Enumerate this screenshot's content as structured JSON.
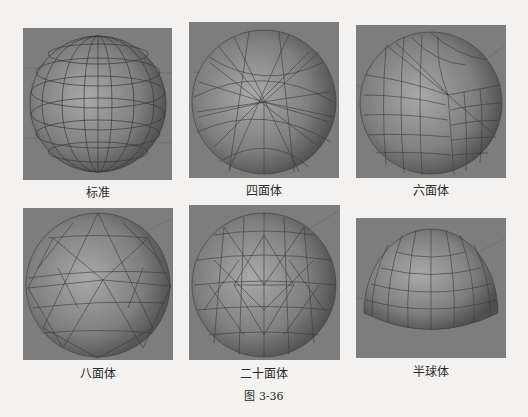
{
  "figure": {
    "label": "图 3-36",
    "panels": [
      {
        "id": "standard",
        "caption": "标准"
      },
      {
        "id": "tetrahedron",
        "caption": "四面体"
      },
      {
        "id": "hexahedron",
        "caption": "六面体"
      },
      {
        "id": "octahedron",
        "caption": "八面体"
      },
      {
        "id": "icosahedron",
        "caption": "二十面体"
      },
      {
        "id": "hemisphere",
        "caption": "半球体"
      }
    ]
  },
  "colors": {
    "background": "#f3f2f0",
    "viewport": "#7d7d7d",
    "sphere": "#8a8a8a",
    "wire": "#3a3a3a"
  }
}
